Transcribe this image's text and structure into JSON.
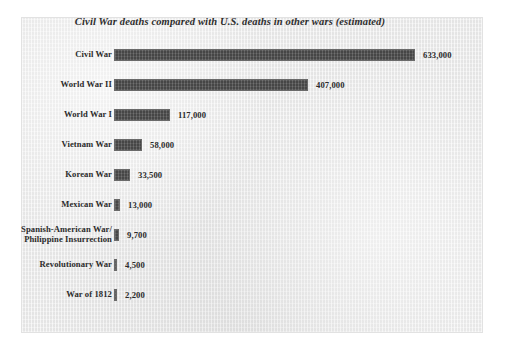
{
  "chart_data": {
    "type": "bar",
    "orientation": "horizontal",
    "title": "Civil War deaths compared with U.S. deaths in other wars (estimated)",
    "xlabel": "",
    "ylabel": "",
    "grid": false,
    "legend": "none",
    "xlim": [
      0,
      633000
    ],
    "categories": [
      "Civil War",
      "World War II",
      "World War I",
      "Vietnam War",
      "Korean War",
      "Mexican War",
      "Spanish-American War/\nPhilippine Insurrection",
      "Revolutionary War",
      "War of 1812"
    ],
    "values": [
      633000,
      407000,
      117000,
      58000,
      33500,
      13000,
      9700,
      4500,
      2200
    ],
    "value_labels": [
      "633,000",
      "407,000",
      "117,000",
      "58,000",
      "33,500",
      "13,000",
      "9,700",
      "4,500",
      "2,200"
    ],
    "bar_color": "#545454",
    "background_color": "#ebebeb"
  },
  "rows": [
    {
      "label": "Civil War",
      "value": 633000,
      "value_label": "633,000"
    },
    {
      "label": "World War II",
      "value": 407000,
      "value_label": "407,000"
    },
    {
      "label": "World War I",
      "value": 117000,
      "value_label": "117,000"
    },
    {
      "label": "Vietnam War",
      "value": 58000,
      "value_label": "58,000"
    },
    {
      "label": "Korean War",
      "value": 33500,
      "value_label": "33,500"
    },
    {
      "label": "Mexican War",
      "value": 13000,
      "value_label": "13,000"
    },
    {
      "label": "Spanish-American War/\nPhilippine Insurrection",
      "value": 9700,
      "value_label": "9,700"
    },
    {
      "label": "Revolutionary War",
      "value": 4500,
      "value_label": "4,500"
    },
    {
      "label": "War of 1812",
      "value": 2200,
      "value_label": "2,200"
    }
  ]
}
